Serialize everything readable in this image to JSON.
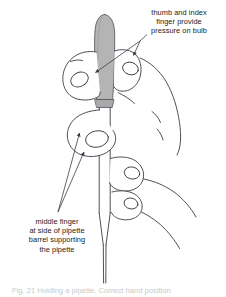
{
  "figure": {
    "type": "line-art instructional diagram",
    "background_color": "#ffffff",
    "line_color": "#3c3c46",
    "bulb_fill_color": "#b4b4b4",
    "text_color": "#1a1a1a"
  },
  "annotations": {
    "top": {
      "id": "thumb-index-annotation",
      "lines": [
        "thumb and index",
        "finger provide",
        "pressure on bulb"
      ],
      "full_text": "thumb and index finger provide pressure on bulb",
      "leader_count": 2,
      "points_to": [
        "pipette bulb",
        "index fingertip"
      ]
    },
    "bottom": {
      "id": "middle-finger-annotation",
      "lines": [
        "middle finger",
        "at side of pipette",
        "barrel supporting",
        "the pipette"
      ],
      "full_text": "middle finger at side of pipette barrel supporting the pipette",
      "leader_count": 2,
      "points_to": [
        "middle finger upper contact",
        "middle finger lower contact"
      ]
    }
  },
  "caption": {
    "text": "Fig. 21  Holding a pipette. Correct hand position"
  },
  "parts": [
    {
      "name": "bulb",
      "label": "pipette bulb"
    },
    {
      "name": "barrel",
      "label": "pipette barrel"
    },
    {
      "name": "tip",
      "label": "pipette tip"
    },
    {
      "name": "thumb",
      "label": "thumb"
    },
    {
      "name": "index-finger",
      "label": "index finger"
    },
    {
      "name": "middle-finger",
      "label": "middle finger"
    },
    {
      "name": "ring-finger",
      "label": "ring finger"
    },
    {
      "name": "little-finger",
      "label": "little finger"
    }
  ]
}
